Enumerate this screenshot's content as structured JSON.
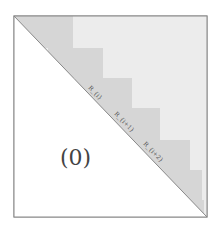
{
  "diagram": {
    "lower_label": "(0)",
    "block_labels": [
      "R_{i}",
      "R_{i+1}",
      "R_{i+2}"
    ],
    "colors": {
      "border": "#888888",
      "upper_fill": "#ececec",
      "block_fill": "#d0d0d0",
      "overlap_fill": "#b8b8b8"
    }
  }
}
